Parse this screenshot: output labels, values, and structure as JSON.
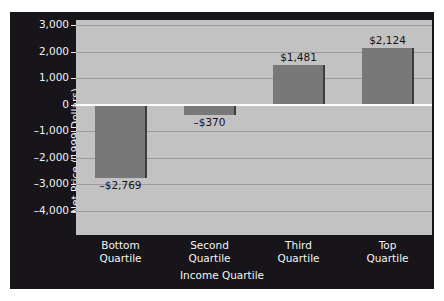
{
  "chart_data": {
    "type": "bar",
    "title": "",
    "subtitle": "",
    "xlabel": "Income Quartile",
    "ylabel": "Net Price (1999 Dollars)",
    "categories": [
      "Bottom Quartile",
      "Second Quartile",
      "Third Quartile",
      "Top Quartile"
    ],
    "category_lines": [
      [
        "Bottom",
        "Quartile"
      ],
      [
        "Second",
        "Quartile"
      ],
      [
        "Third",
        "Quartile"
      ],
      [
        "Top",
        "Quartile"
      ]
    ],
    "values": [
      -2769,
      -370,
      1481,
      2124
    ],
    "data_labels": [
      "–$2,769",
      "–$370",
      "$1,481",
      "$2,124"
    ],
    "ylim": [
      -4000,
      3000
    ],
    "yticks": [
      3000,
      2000,
      1000,
      0,
      -1000,
      -2000,
      -3000,
      -4000
    ],
    "ytick_labels": [
      "3,000",
      "2,000",
      "1,000",
      "0",
      "–1,000",
      "–2,000",
      "–3,000",
      "–4,000"
    ],
    "grid": true,
    "grid_axis": "y",
    "legend": false,
    "legend_position": "none",
    "zero_line": true,
    "colors": {
      "bar_fill": "#787878",
      "bar_edge": "#3d3d3d",
      "plot_background": "#c2c2c2",
      "frame_background": "#17151a",
      "gridline": "#9a9a9a",
      "zero_line": "#fdfdfd",
      "axis_text": "#f2f2f2",
      "data_label_text": "#14121a",
      "page_background": "#ffffff"
    }
  }
}
